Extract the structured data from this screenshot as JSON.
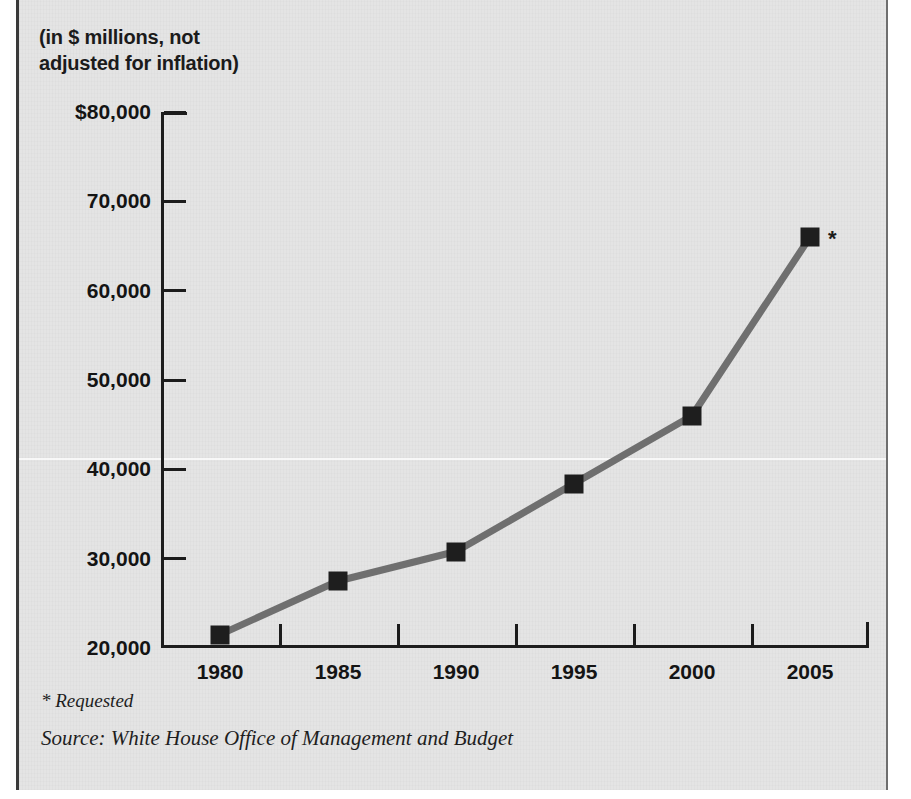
{
  "figure": {
    "caption_line1": "(in $ millions, not",
    "caption_line2": "adjusted for inflation)",
    "footnote_requested": "* Requested",
    "footnote_source": "Source: White House Office of Management and Budget",
    "point_note_2005": "*",
    "colors": {
      "background": "#e4e4e4",
      "axis": "#1c1c1c",
      "line": "#6f6f6f",
      "marker": "#1e1e1e",
      "text": "#141414"
    }
  },
  "chart_data": {
    "type": "line",
    "title": "",
    "subtitle": "(in $ millions, not adjusted for inflation)",
    "xlabel": "",
    "ylabel": "",
    "categories": [
      "1980",
      "1985",
      "1990",
      "1995",
      "2000",
      "2005"
    ],
    "x": [
      1980,
      1985,
      1990,
      1995,
      2000,
      2005
    ],
    "values": [
      21500,
      27500,
      30800,
      38400,
      46000,
      66000
    ],
    "series": [
      {
        "name": "Budget",
        "values": [
          21500,
          27500,
          30800,
          38400,
          46000,
          66000
        ]
      }
    ],
    "ylim": [
      20000,
      80000
    ],
    "ytick_values": [
      20000,
      30000,
      40000,
      50000,
      60000,
      70000,
      80000
    ],
    "ytick_labels": [
      "20,000",
      "30,000",
      "40,000",
      "50,000",
      "60,000",
      "70,000",
      "$80,000"
    ],
    "xtick_labels": [
      "1980",
      "1985",
      "1990",
      "1995",
      "2000",
      "2005"
    ],
    "grid": false,
    "legend": "none",
    "annotations": [
      {
        "text": "*",
        "x": "2005",
        "meaning": "Requested"
      }
    ],
    "marker": "square",
    "line_color": "#6f6f6f",
    "marker_color": "#1e1e1e"
  }
}
